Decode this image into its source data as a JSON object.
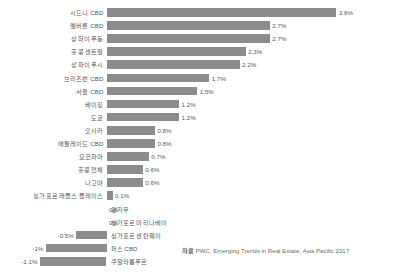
{
  "chart_data": {
    "type": "bar",
    "orientation": "horizontal",
    "title": "",
    "subtitle": "",
    "xlabel": "",
    "ylabel": "",
    "grid": false,
    "legend": null,
    "xlim": [
      -1.3,
      4.0
    ],
    "categories": [
      "시드니 CBD",
      "멜버른 CBD",
      "상하이 푸동",
      "홍콩 센트럴",
      "상하이 푸시",
      "브리즈번 CBD",
      "서울 CBD",
      "베이징",
      "도쿄",
      "오사카",
      "애들레이드 CBD",
      "요코하마",
      "홍콩 전체",
      "나고야",
      "싱가포르 래플스 플레이스",
      "광저우",
      "싱가포르 마리나베이",
      "싱가포르 센탄웨이",
      "퍼스 CBD",
      "쿠알라룸푸르"
    ],
    "values": [
      3.8,
      2.7,
      2.7,
      2.3,
      2.2,
      1.7,
      1.5,
      1.2,
      1.2,
      0.8,
      0.8,
      0.7,
      0.6,
      0.6,
      0.1,
      0,
      0,
      -0.5,
      -1.0,
      -1.1
    ],
    "value_labels": [
      "3.8%",
      "2.7%",
      "2.7%",
      "2.3%",
      "2.2%",
      "1.7%",
      "1.5%",
      "1.2%",
      "1.2%",
      "0.8%",
      "0.8%",
      "0.7%",
      "0.6%",
      "0.6%",
      "0.1%",
      "0%",
      "0%",
      "-0.5%",
      "-1%",
      "-1.1%"
    ],
    "bar_color": "#8c8c8c",
    "label_color": "#595959",
    "background": "#ffffff"
  },
  "source": {
    "tag": "자료",
    "text": "PWC, Emerging Trends in Real Estate, Asia Pacific 2017"
  }
}
